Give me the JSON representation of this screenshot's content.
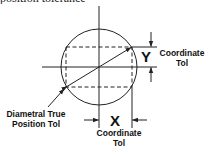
{
  "caption_clipped": "position tolerance",
  "labels": {
    "diametral_line1": "Diametral True",
    "diametral_line2": "Position Tol",
    "y_symbol": "Y",
    "y_label_line1": "Coordinate",
    "y_label_line2": "Tol",
    "x_symbol": "X",
    "x_label_line1": "Coordinate",
    "x_label_line2": "Tol"
  },
  "colors": {
    "stroke": "#222222",
    "background": "#ffffff"
  }
}
